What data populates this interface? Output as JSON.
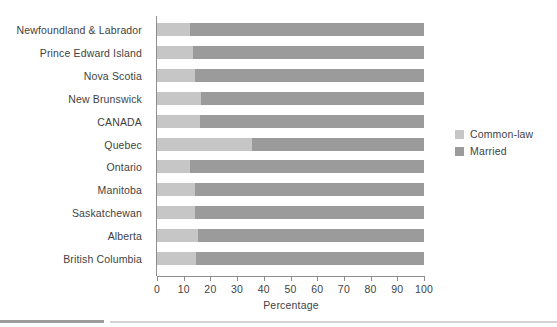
{
  "chart_data": {
    "type": "bar",
    "orientation": "horizontal",
    "stacked": true,
    "title": "",
    "xlabel": "Percentage",
    "ylabel": "",
    "xlim": [
      0,
      100
    ],
    "grid": false,
    "legend_position": "right",
    "categories": [
      "Newfoundland & Labrador",
      "Prince Edward Island",
      "Nova Scotia",
      "New Brunswick",
      "CANADA",
      "Quebec",
      "Ontario",
      "Manitoba",
      "Saskatchewan",
      "Alberta",
      "British Columbia"
    ],
    "series": [
      {
        "name": "Common-law",
        "color": "#c6c6c6",
        "values": [
          12.4,
          13.5,
          14.2,
          16.5,
          16.1,
          35.6,
          12.4,
          14.2,
          14.2,
          15.4,
          14.6
        ]
      },
      {
        "name": "Married",
        "color": "#9b9b9b",
        "values": [
          87.6,
          86.5,
          85.8,
          83.5,
          83.9,
          64.4,
          87.6,
          85.8,
          85.8,
          84.6,
          85.4
        ]
      }
    ],
    "xticks": [
      0,
      10,
      20,
      30,
      40,
      50,
      60,
      70,
      80,
      90,
      100
    ],
    "xtick_labels": [
      "0",
      "10",
      "20",
      "30",
      "40",
      "50",
      "60",
      "70",
      "80",
      "90",
      "100"
    ]
  },
  "legend": {
    "items": [
      {
        "label": "Common-law",
        "color": "#c6c6c6"
      },
      {
        "label": "Married",
        "color": "#9b9b9b"
      }
    ]
  },
  "axis": {
    "x_title": "Percentage"
  }
}
